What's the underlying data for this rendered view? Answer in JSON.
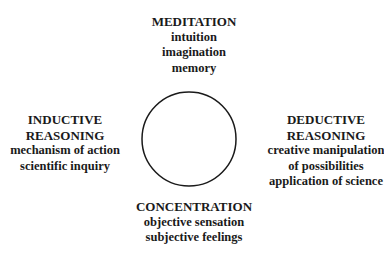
{
  "diagram": {
    "center_shape": "circle",
    "nodes": {
      "top": {
        "title": "MEDITATION",
        "items": [
          "intuition",
          "imagination",
          "memory"
        ]
      },
      "left": {
        "title_lines": [
          "INDUCTIVE",
          "REASONING"
        ],
        "items": [
          "mechanism of action",
          "scientific inquiry"
        ]
      },
      "right": {
        "title_lines": [
          "DEDUCTIVE",
          "REASONING"
        ],
        "items": [
          "creative manipulation",
          "of possibilities",
          "application of science"
        ]
      },
      "bottom": {
        "title": "CONCENTRATION",
        "items": [
          "objective sensation",
          "subjective feelings"
        ]
      }
    }
  }
}
